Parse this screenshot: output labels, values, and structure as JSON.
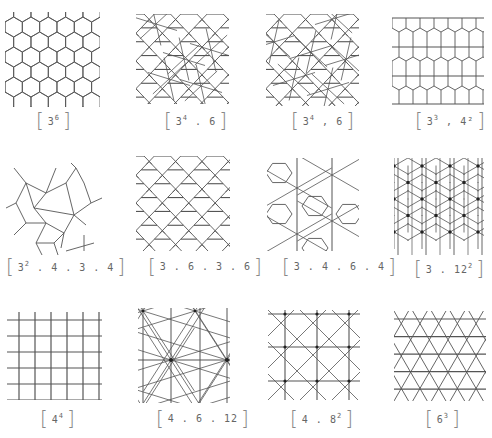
{
  "stroke_color": "#555555",
  "panels": [
    {
      "id": "3-6",
      "base": "3",
      "sup": "6",
      "rest": "",
      "label_plain": "[3^6]",
      "pattern": "hex"
    },
    {
      "id": "3-4-6-a",
      "base": "3",
      "sup": "4",
      "rest": ". 6",
      "label_plain": "[3^4 . 6]",
      "pattern": "snubhex"
    },
    {
      "id": "3-4-6-b",
      "base": "3",
      "sup": "4",
      "rest": ", 6",
      "label_plain": "[3^4 , 6]",
      "pattern": "snubhex2"
    },
    {
      "id": "3-3-4-2",
      "base": "3",
      "sup": "3",
      "rest": ", 4²",
      "label_plain": "[3^3 , 4^2]",
      "pattern": "elongtri"
    },
    {
      "id": "3-2-4-3-4",
      "base": "3",
      "sup": "2",
      "rest": ". 4 . 3 . 4",
      "label_plain": "[3^2 . 4 . 3 . 4]",
      "pattern": "cairo"
    },
    {
      "id": "3-6-3-6",
      "base": "3 . 6 . 3 . 6",
      "sup": "",
      "rest": "",
      "label_plain": "[3.6.3.6]",
      "pattern": "rhombille"
    },
    {
      "id": "3-4-6-4",
      "base": "3 . 4 . 6 . 4",
      "sup": "",
      "rest": "",
      "label_plain": "[3.4.6.4]",
      "pattern": "deltoid"
    },
    {
      "id": "3-12-2",
      "base": "3 . 12",
      "sup": "2",
      "rest": "",
      "label_plain": "[3 . 12^2]",
      "pattern": "triakis"
    },
    {
      "id": "4-4",
      "base": "4",
      "sup": "4",
      "rest": "",
      "label_plain": "[4^4]",
      "pattern": "square"
    },
    {
      "id": "4-6-12",
      "base": "4 . 6 . 12",
      "sup": "",
      "rest": "",
      "label_plain": "[4 . 6 . 12]",
      "pattern": "kisrhombille"
    },
    {
      "id": "4-8-2",
      "base": "4 . 8",
      "sup": "2",
      "rest": "",
      "label_plain": "[4 . 8^2]",
      "pattern": "tetrakis"
    },
    {
      "id": "6-3",
      "base": "6",
      "sup": "3",
      "rest": "",
      "label_plain": "[6^3]",
      "pattern": "triangular"
    }
  ]
}
